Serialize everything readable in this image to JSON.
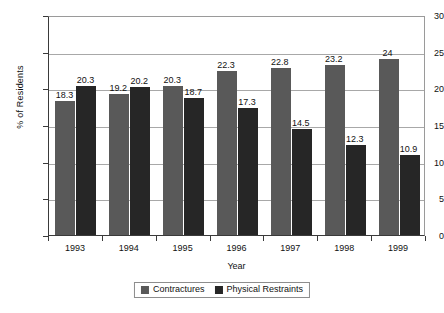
{
  "chart_data": {
    "type": "bar",
    "title": "",
    "subtitle": "",
    "xlabel": "Year",
    "ylabel": "% of Residents",
    "categories": [
      "1993",
      "1994",
      "1995",
      "1996",
      "1997",
      "1998",
      "1999"
    ],
    "series": [
      {
        "name": "Contractures",
        "color": "#595959",
        "values": [
          18.3,
          19.2,
          20.3,
          22.3,
          22.8,
          23.2,
          24
        ],
        "labels": [
          "18.3",
          "19.2",
          "20.3",
          "22.3",
          "22.8",
          "23.2",
          "24"
        ]
      },
      {
        "name": "Physical Restraints",
        "color": "#262626",
        "values": [
          20.3,
          20.2,
          18.7,
          17.3,
          14.5,
          12.3,
          10.9
        ],
        "labels": [
          "20.3",
          "20.2",
          "18.7",
          "17.3",
          "14.5",
          "12.3",
          "10.9"
        ]
      }
    ],
    "ylim": [
      0,
      30
    ],
    "yticks": [
      0,
      5,
      10,
      15,
      20,
      25,
      30
    ],
    "ytick_labels": [
      "0",
      "5",
      "10",
      "15",
      "20",
      "25",
      "30"
    ],
    "grid": "horizontal",
    "legend_position": "bottom",
    "data_labels": true
  }
}
